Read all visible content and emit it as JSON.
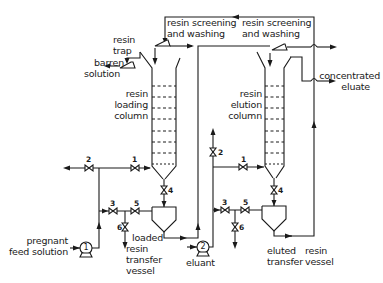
{
  "diagram": {
    "type": "process-flow-diagram",
    "labels": {
      "resin_screening_1": [
        "resin screening",
        "and washing"
      ],
      "resin_screening_2": [
        "resin screening",
        "and washing"
      ],
      "resin_trap": [
        "resin",
        "trap"
      ],
      "barren_solution": [
        "barren",
        "solution"
      ],
      "loading_column": [
        "resin",
        "loading",
        "column"
      ],
      "elution_column": [
        "resin",
        "elution",
        "column"
      ],
      "concentrated_eluate": [
        "concentrated",
        "eluate"
      ],
      "pregnant_feed": [
        "pregnant",
        "feed solution"
      ],
      "loaded_vessel": [
        "loaded",
        "resin",
        "transfer",
        "vessel"
      ],
      "eluant": "eluant",
      "eluted_vessel": [
        "eluted",
        "transfer"
      ],
      "resin_vessel": [
        "resin",
        "vessel"
      ]
    },
    "pumps": [
      "1",
      "2"
    ],
    "valves_loading": [
      "1",
      "2",
      "3",
      "4",
      "5",
      "6"
    ],
    "valves_elution": [
      "1",
      "2",
      "3",
      "4",
      "5",
      "6"
    ]
  }
}
